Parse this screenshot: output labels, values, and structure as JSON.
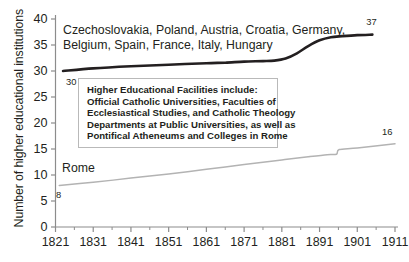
{
  "chart_data": {
    "type": "line",
    "title": "",
    "xlabel": "",
    "ylabel": "Number of higher educational institutions",
    "xlim": [
      1821,
      1911
    ],
    "ylim": [
      0,
      40
    ],
    "xticks": [
      "1821",
      "1831",
      "1841",
      "1851",
      "1861",
      "1871",
      "1881",
      "1891",
      "1901",
      "1911"
    ],
    "xtick_values": [
      1821,
      1831,
      1841,
      1851,
      1861,
      1871,
      1881,
      1891,
      1901,
      1911
    ],
    "minor_xtick_values": [
      1826,
      1836,
      1846,
      1856,
      1866,
      1876,
      1886,
      1896,
      1906
    ],
    "yticks": [
      "0",
      "5",
      "10",
      "15",
      "20",
      "25",
      "30",
      "35",
      "40"
    ],
    "ytick_values": [
      0,
      5,
      10,
      15,
      20,
      25,
      30,
      35,
      40
    ],
    "grid": false,
    "legend_position": "inline-labels",
    "series": [
      {
        "name": "Czechoslovakia, Poland, Austria, Croatia, Germany, Belgium, Spain, France, Italy, Hungary",
        "label_line1": "Czechoslovakia, Poland, Austria, Croatia, Germany,",
        "label_line2": "Belgium, Spain, France, Italy, Hungary",
        "color": "#231f20",
        "line_width": 2.6,
        "start_value_label": "30",
        "end_value_label": "37",
        "x": [
          1823,
          1831,
          1841,
          1851,
          1861,
          1866,
          1871,
          1876,
          1879,
          1882,
          1885,
          1888,
          1891,
          1894,
          1897,
          1901,
          1905
        ],
        "values": [
          30.0,
          30.5,
          30.9,
          31.2,
          31.5,
          31.6,
          31.8,
          31.9,
          32.0,
          32.4,
          33.4,
          34.8,
          35.9,
          36.5,
          36.7,
          36.9,
          37.0
        ]
      },
      {
        "name": "Rome",
        "label_line1": "Rome",
        "color": "#b3b3b3",
        "line_width": 1.5,
        "start_value_label": "8",
        "end_value_label": "16",
        "x": [
          1822,
          1831,
          1841,
          1851,
          1861,
          1871,
          1881,
          1888,
          1893,
          1895.5,
          1896.2,
          1901,
          1911
        ],
        "values": [
          8.0,
          8.6,
          9.4,
          10.2,
          11.1,
          12.0,
          12.9,
          13.5,
          13.9,
          14.0,
          14.9,
          15.2,
          16.0
        ]
      }
    ],
    "annotation_box": {
      "lines": [
        "Higher Educational Facilities include:",
        "Official Catholic Universities, Faculties of",
        "Ecclesiastical Studies, and Catholic Theology",
        "Departments at Public Universities, as well as",
        "Pontifical Atheneums and Colleges in Rome"
      ]
    },
    "colors": {
      "axis": "#8c8c8c",
      "dark_series": "#231f20",
      "light_series": "#b3b3b3",
      "text": "#231f20",
      "box_border": "#b9b9b9",
      "background": "#ffffff"
    }
  }
}
